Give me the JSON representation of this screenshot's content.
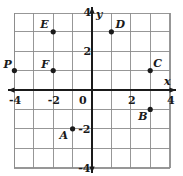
{
  "figure": {
    "background_color": "#ffffff",
    "grid_color": "#8c8c8c",
    "axis_color": "#1a1a1a",
    "point_color": "#1a1a1a",
    "label_color": "#1a1a1a"
  },
  "chart_data": {
    "type": "scatter",
    "title": "",
    "xlabel": "x",
    "ylabel": "y",
    "xlim": [
      -5,
      4
    ],
    "ylim": [
      -5,
      5
    ],
    "grid": true,
    "legend": "none",
    "x_tick_labels": [
      "-4",
      "-2",
      "0",
      "2",
      "4"
    ],
    "x_tick_values": [
      -4,
      -2,
      0,
      2,
      4
    ],
    "y_tick_labels": [
      "4",
      "2",
      "0",
      "-2",
      "-4"
    ],
    "y_tick_values": [
      4,
      2,
      0,
      -2,
      -4
    ],
    "points": [
      {
        "label": "P",
        "x": -4,
        "y": 1,
        "label_dx": -11,
        "label_dy": -12
      },
      {
        "label": "F",
        "x": -2,
        "y": 1,
        "label_dx": -12,
        "label_dy": -12
      },
      {
        "label": "E",
        "x": -2,
        "y": 3,
        "label_dx": -13,
        "label_dy": -13
      },
      {
        "label": "A",
        "x": -1,
        "y": -2,
        "label_dx": -13,
        "label_dy": 1
      },
      {
        "label": "D",
        "x": 1,
        "y": 3,
        "label_dx": 4,
        "label_dy": -13
      },
      {
        "label": "C",
        "x": 3,
        "y": 1,
        "label_dx": 3,
        "label_dy": -13
      },
      {
        "label": "B",
        "x": 3,
        "y": -1,
        "label_dx": -12,
        "label_dy": 2
      }
    ]
  },
  "axes": {
    "x_axis_name": "x",
    "y_axis_name": "y"
  }
}
